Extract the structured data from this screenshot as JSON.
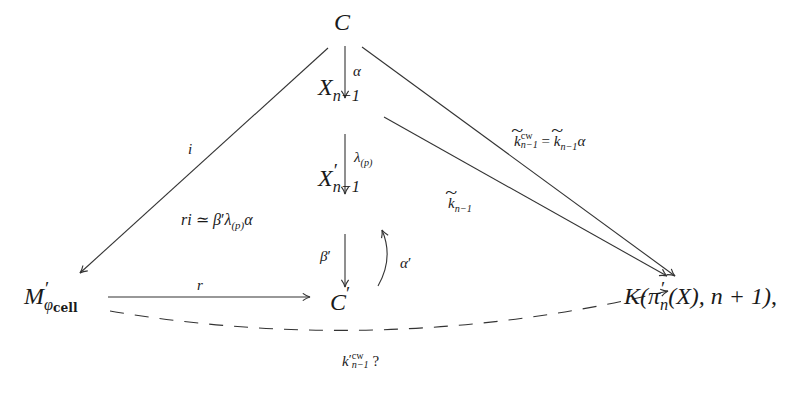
{
  "diagram": {
    "type": "commutative-diagram",
    "nodes": {
      "C": {
        "base": "C",
        "prime": "",
        "sub": ""
      },
      "X": {
        "base": "X",
        "prime": "",
        "sub": "n−1"
      },
      "Xp": {
        "base": "X",
        "prime": "′",
        "sub": "n−1"
      },
      "Cp": {
        "base": "C",
        "prime": "′",
        "sub": ""
      },
      "M": {
        "base": "M",
        "prime": "′",
        "sub_main": "φ",
        "sub_sub": "cell"
      },
      "K": {
        "text_head": "K(π",
        "prime": "′",
        "sub": "n",
        "text_tail": "(X), n + 1)",
        "trailing": ","
      }
    },
    "edges": [
      {
        "from": "C",
        "to": "X",
        "label": "α",
        "style": "solid"
      },
      {
        "from": "X",
        "to": "Xp",
        "label_main": "λ",
        "label_sub": "(p)",
        "style": "solid"
      },
      {
        "from": "Xp",
        "to": "Cp",
        "label_main": "β",
        "label_prime": "′",
        "style": "solid"
      },
      {
        "from": "Cp",
        "to": "Xp",
        "label_main": "α",
        "label_prime": "′",
        "style": "curved"
      },
      {
        "from": "C",
        "to": "M",
        "label": "i",
        "style": "solid"
      },
      {
        "from": "M",
        "to": "Cp",
        "label": "r",
        "style": "solid"
      },
      {
        "from": "X",
        "to": "K",
        "label_main": "k",
        "label_sub": "n−1",
        "tilde": true,
        "style": "solid"
      },
      {
        "from": "C",
        "to": "K",
        "label_lhs_main": "k",
        "label_lhs_sup": "cw",
        "label_lhs_sub": "n−1",
        "label_eq": " = ",
        "label_rhs_main": "k",
        "label_rhs_sub": "n−1",
        "label_rhs_tail": "α",
        "tilde": true,
        "style": "solid"
      },
      {
        "from": "M",
        "to": "K",
        "label_main": "k",
        "label_prime": "′",
        "label_sup": "cw",
        "label_sub": "n−1",
        "label_q": " ?",
        "style": "dashed"
      }
    ],
    "annotation": {
      "r": "r",
      "i": "i",
      "simeq": " ≃ ",
      "beta": "β",
      "prime": "′",
      "lambda": "λ",
      "sub": "(p)",
      "alpha": "α"
    }
  }
}
